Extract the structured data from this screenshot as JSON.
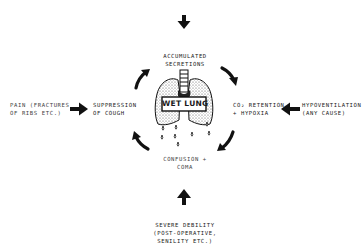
{
  "diagram": {
    "type": "cycle",
    "center": {
      "label": "WET LUNG",
      "illustration": "lungs-with-trachea-and-dripping-fluid"
    },
    "cycle_nodes": [
      {
        "id": "secretions",
        "lines": [
          "ACCUMULATED",
          "SECRETIONS"
        ],
        "position": "top"
      },
      {
        "id": "co2",
        "lines": [
          "CO₂ RETENTION",
          "+ HYPOXIA"
        ],
        "position": "right"
      },
      {
        "id": "confusion",
        "lines": [
          "CONFUSION +",
          "COMA"
        ],
        "position": "bottom"
      },
      {
        "id": "cough",
        "lines": [
          "SUPPRESSION",
          "OF COUGH"
        ],
        "position": "left"
      }
    ],
    "cycle_direction": "clockwise",
    "inputs": [
      {
        "id": "top-input",
        "lines": [],
        "arrow": "down",
        "target": "secretions"
      },
      {
        "id": "pain",
        "lines": [
          "PAIN (FRACTURES",
          "OF RIBS ETC.)"
        ],
        "arrow": "right",
        "target": "cough"
      },
      {
        "id": "hypoventilation",
        "lines": [
          "HYPOVENTILATION",
          "(ANY CAUSE)"
        ],
        "arrow": "left",
        "target": "co2"
      },
      {
        "id": "debility",
        "lines": [
          "SEVERE DEBILITY",
          "(POST-OPERATIVE,",
          "SENILITY ETC.)"
        ],
        "arrow": "up",
        "target": "confusion"
      }
    ],
    "colors": {
      "ink": "#1a1a1a",
      "background": "#ffffff",
      "lung_fill": "#e6e6e6"
    }
  }
}
